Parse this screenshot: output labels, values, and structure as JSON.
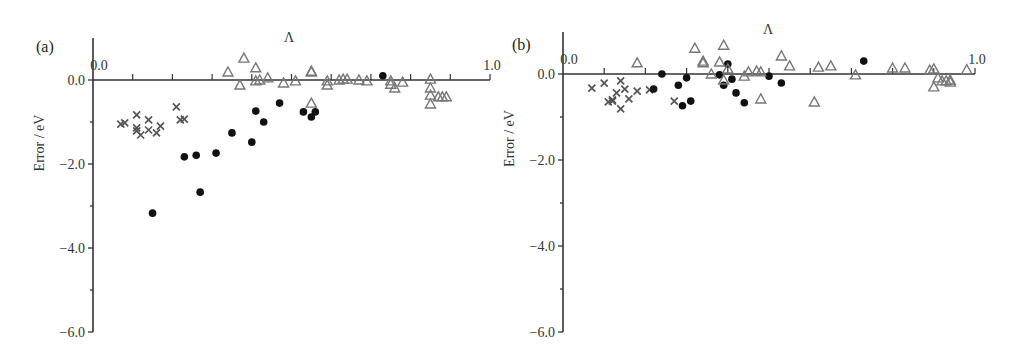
{
  "chart_data": [
    {
      "type": "scatter",
      "panel_label": "(a)",
      "title": "",
      "xlabel": "Λ",
      "ylabel": "Error / eV",
      "xlim": [
        0.0,
        1.0
      ],
      "ylim": [
        -6.0,
        1.0
      ],
      "x_tick_labels": [
        "0.0",
        "1.0"
      ],
      "y_tick_labels": [
        "0.0",
        "−2.0",
        "−4.0",
        "−6.0"
      ],
      "grid": false,
      "legend": null,
      "series": [
        {
          "name": "cross",
          "marker": "x",
          "color": "#555555",
          "points": [
            [
              0.07,
              -1.05
            ],
            [
              0.08,
              -1.02
            ],
            [
              0.11,
              -0.83
            ],
            [
              0.11,
              -1.21
            ],
            [
              0.11,
              -1.14
            ],
            [
              0.12,
              -1.31
            ],
            [
              0.14,
              -0.95
            ],
            [
              0.14,
              -1.19
            ],
            [
              0.16,
              -1.26
            ],
            [
              0.17,
              -1.1
            ],
            [
              0.21,
              -0.64
            ],
            [
              0.22,
              -0.95
            ],
            [
              0.23,
              -0.93
            ]
          ]
        },
        {
          "name": "filled circle",
          "marker": "o",
          "color": "#111111",
          "points": [
            [
              0.15,
              -3.17
            ],
            [
              0.23,
              -1.83
            ],
            [
              0.26,
              -1.79
            ],
            [
              0.27,
              -2.67
            ],
            [
              0.31,
              -1.74
            ],
            [
              0.35,
              -1.26
            ],
            [
              0.4,
              -1.48
            ],
            [
              0.41,
              -0.74
            ],
            [
              0.43,
              -1.0
            ],
            [
              0.47,
              -0.55
            ],
            [
              0.53,
              -0.76
            ],
            [
              0.55,
              -0.88
            ],
            [
              0.56,
              -0.76
            ],
            [
              0.73,
              0.1
            ]
          ]
        },
        {
          "name": "open triangle",
          "marker": "^",
          "color": "#777777",
          "points": [
            [
              0.34,
              0.19
            ],
            [
              0.38,
              0.52
            ],
            [
              0.37,
              -0.12
            ],
            [
              0.41,
              0.29
            ],
            [
              0.41,
              -0.02
            ],
            [
              0.42,
              0.0
            ],
            [
              0.44,
              0.05
            ],
            [
              0.48,
              -0.07
            ],
            [
              0.51,
              -0.02
            ],
            [
              0.55,
              0.21
            ],
            [
              0.55,
              0.19
            ],
            [
              0.55,
              -0.55
            ],
            [
              0.59,
              -0.02
            ],
            [
              0.59,
              -0.12
            ],
            [
              0.62,
              0.0
            ],
            [
              0.64,
              0.02
            ],
            [
              0.67,
              0.0
            ],
            [
              0.69,
              -0.02
            ],
            [
              0.75,
              -0.02
            ],
            [
              0.75,
              -0.1
            ],
            [
              0.76,
              -0.19
            ],
            [
              0.78,
              -0.05
            ],
            [
              0.85,
              0.02
            ],
            [
              0.85,
              -0.19
            ],
            [
              0.85,
              -0.57
            ],
            [
              0.85,
              -0.36
            ],
            [
              0.87,
              -0.4
            ],
            [
              0.88,
              -0.4
            ],
            [
              0.89,
              -0.4
            ],
            [
              0.63,
              0.02
            ]
          ]
        }
      ]
    },
    {
      "type": "scatter",
      "panel_label": "(b)",
      "title": "",
      "xlabel": "Λ",
      "ylabel": "Error / eV",
      "xlim": [
        0.0,
        1.0
      ],
      "ylim": [
        -6.0,
        1.0
      ],
      "x_tick_labels": [
        "0.0",
        "1.0"
      ],
      "y_tick_labels": [
        "0.0",
        "−2.0",
        "−4.0",
        "−6.0"
      ],
      "grid": false,
      "legend": null,
      "series": [
        {
          "name": "cross",
          "marker": "x",
          "color": "#555555",
          "points": [
            [
              0.07,
              -0.33
            ],
            [
              0.1,
              -0.21
            ],
            [
              0.11,
              -0.65
            ],
            [
              0.12,
              -0.6
            ],
            [
              0.12,
              -0.63
            ],
            [
              0.13,
              -0.44
            ],
            [
              0.14,
              -0.81
            ],
            [
              0.14,
              -0.16
            ],
            [
              0.15,
              -0.35
            ],
            [
              0.16,
              -0.58
            ],
            [
              0.18,
              -0.4
            ],
            [
              0.21,
              -0.37
            ],
            [
              0.27,
              -0.63
            ]
          ]
        },
        {
          "name": "filled circle",
          "marker": "o",
          "color": "#111111",
          "points": [
            [
              0.22,
              -0.35
            ],
            [
              0.24,
              0.0
            ],
            [
              0.28,
              -0.26
            ],
            [
              0.29,
              -0.74
            ],
            [
              0.3,
              -0.09
            ],
            [
              0.31,
              -0.63
            ],
            [
              0.38,
              -0.02
            ],
            [
              0.39,
              -0.26
            ],
            [
              0.4,
              0.23
            ],
            [
              0.41,
              -0.12
            ],
            [
              0.42,
              -0.44
            ],
            [
              0.44,
              -0.67
            ],
            [
              0.5,
              -0.05
            ],
            [
              0.53,
              -0.21
            ],
            [
              0.73,
              0.3
            ]
          ]
        },
        {
          "name": "open triangle",
          "marker": "^",
          "color": "#777777",
          "points": [
            [
              0.18,
              0.26
            ],
            [
              0.32,
              0.6
            ],
            [
              0.34,
              0.3
            ],
            [
              0.34,
              0.26
            ],
            [
              0.36,
              0.0
            ],
            [
              0.38,
              0.28
            ],
            [
              0.39,
              0.67
            ],
            [
              0.39,
              -0.14
            ],
            [
              0.4,
              0.12
            ],
            [
              0.44,
              -0.05
            ],
            [
              0.45,
              0.05
            ],
            [
              0.47,
              0.07
            ],
            [
              0.48,
              0.05
            ],
            [
              0.48,
              -0.58
            ],
            [
              0.53,
              0.42
            ],
            [
              0.55,
              0.19
            ],
            [
              0.61,
              -0.65
            ],
            [
              0.62,
              0.16
            ],
            [
              0.65,
              0.19
            ],
            [
              0.71,
              -0.02
            ],
            [
              0.8,
              0.14
            ],
            [
              0.83,
              0.14
            ],
            [
              0.89,
              0.09
            ],
            [
              0.9,
              0.12
            ],
            [
              0.9,
              -0.3
            ],
            [
              0.91,
              -0.09
            ],
            [
              0.92,
              -0.16
            ],
            [
              0.93,
              -0.16
            ],
            [
              0.94,
              -0.14
            ],
            [
              0.94,
              -0.19
            ],
            [
              0.98,
              0.1
            ]
          ]
        }
      ]
    }
  ]
}
